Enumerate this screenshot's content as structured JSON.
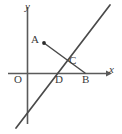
{
  "figure": {
    "background_color": "#ffffff",
    "line_color": "#4a4a4a",
    "axis_color": "#5a5a5a",
    "point_color": "#2b2b2b",
    "width": 122,
    "height": 134
  },
  "axes": {
    "y_axis_label": "y",
    "x_axis_label": "x",
    "origin_label": "O",
    "y_axis": {
      "x": 27,
      "y_top": 7,
      "y_bottom": 124
    },
    "x_axis": {
      "y": 73,
      "x_left": 8,
      "x_right": 106
    }
  },
  "points": [
    {
      "name": "A",
      "label": "A",
      "cx": 44,
      "cy": 43,
      "has_dot": true,
      "label_x": 31,
      "label_y": 34
    },
    {
      "name": "B",
      "label": "B",
      "cx": 85,
      "cy": 73,
      "has_dot": false,
      "label_x": 82,
      "label_y": 74
    },
    {
      "name": "C",
      "label": "C",
      "cx": 66,
      "cy": 56,
      "has_dot": false,
      "label_x": 69,
      "label_y": 55
    },
    {
      "name": "D",
      "label": "D",
      "cx": 55,
      "cy": 73,
      "has_dot": false,
      "label_x": 55,
      "label_y": 74
    },
    {
      "name": "O",
      "label": "O",
      "cx": 27,
      "cy": 73,
      "has_dot": false,
      "label_x": 14,
      "label_y": 74
    }
  ],
  "lines": [
    {
      "name": "diagonal-line",
      "description": "rising straight line through D and C",
      "x1": 16,
      "y1": 128,
      "x2": 110,
      "y2": 5
    },
    {
      "name": "segment-ab",
      "description": "segment from point A down through C to B on the x-axis",
      "x1": 44,
      "y1": 43,
      "x2": 85,
      "y2": 73
    }
  ]
}
